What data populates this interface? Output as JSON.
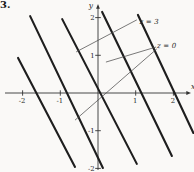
{
  "figure": {
    "problem_number": "3."
  },
  "style": {
    "background": "#faf9f7",
    "ink": "#1e1e1e",
    "axis_color": "#333333",
    "leader_color": "#4d4d4d",
    "text_color": "#262626"
  },
  "chart_data": {
    "type": "line",
    "x_axis": {
      "label": "x",
      "ticks": [
        -2,
        -1,
        1,
        2
      ],
      "range": [
        -2.47,
        2.47
      ]
    },
    "y_axis": {
      "label": "y",
      "ticks": [
        2,
        1,
        -1,
        -2
      ],
      "range": [
        -2.04,
        2.33
      ]
    },
    "grid": false,
    "level_lines": [
      {
        "points": [
          [
            -2.12,
            0.93
          ],
          [
            -0.61,
            -1.96
          ]
        ]
      },
      {
        "points": [
          [
            -1.8,
            2.04
          ],
          [
            0.13,
            -1.99
          ]
        ]
      },
      {
        "points": [
          [
            -0.95,
            1.96
          ],
          [
            1.03,
            -1.88
          ]
        ]
      },
      {
        "points": [
          [
            0.11,
            2.15
          ],
          [
            1.96,
            -1.67
          ]
        ]
      },
      {
        "points": [
          [
            1.06,
            2.07
          ],
          [
            2.53,
            -1.06
          ]
        ]
      }
    ],
    "annotations": [
      {
        "text": "z = 3",
        "anchor": {
          "x": 1.1,
          "y": 1.9
        },
        "leaders": [
          [
            [
              1.03,
              1.94
            ],
            [
              -0.58,
              1.09
            ]
          ]
        ]
      },
      {
        "text": "z = 0",
        "anchor": {
          "x": 1.565,
          "y": 1.25
        },
        "leaders": [
          [
            [
              1.54,
              1.22
            ],
            [
              0.21,
              0.82
            ]
          ],
          [
            [
              1.56,
              1.17
            ],
            [
              -0.61,
              -0.72
            ]
          ]
        ]
      }
    ]
  }
}
